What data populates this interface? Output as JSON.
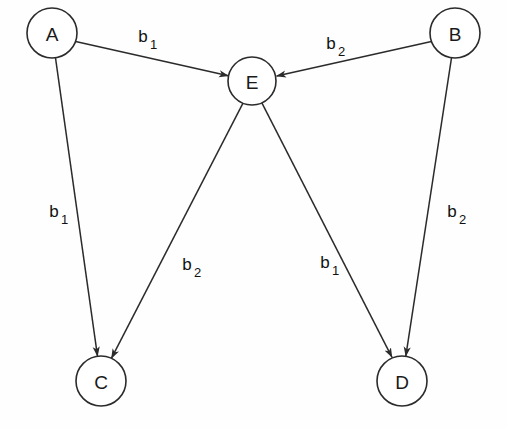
{
  "diagram": {
    "background_color": "#fefefe",
    "stroke_color": "#2b2b2b",
    "text_color": "#111111",
    "nodes": [
      {
        "id": "A",
        "label": "A",
        "cx": 52,
        "cy": 33,
        "r": 25
      },
      {
        "id": "B",
        "label": "B",
        "cx": 455,
        "cy": 33,
        "r": 25
      },
      {
        "id": "E",
        "label": "E",
        "cx": 252,
        "cy": 81,
        "r": 24
      },
      {
        "id": "C",
        "label": "C",
        "cx": 101,
        "cy": 381,
        "r": 25
      },
      {
        "id": "D",
        "label": "D",
        "cx": 402,
        "cy": 381,
        "r": 25
      }
    ],
    "edges": [
      {
        "id": "a-e",
        "from": "A",
        "to": "E",
        "label_base": "b",
        "label_sub": "1",
        "label_x": 143,
        "label_y": 42
      },
      {
        "id": "b-e",
        "from": "B",
        "to": "E",
        "label_base": "b",
        "label_sub": "2",
        "label_x": 331,
        "label_y": 49
      },
      {
        "id": "a-c",
        "from": "A",
        "to": "C",
        "label_base": "b",
        "label_sub": "1",
        "label_x": 54,
        "label_y": 217
      },
      {
        "id": "e-c",
        "from": "E",
        "to": "C",
        "label_base": "b",
        "label_sub": "2",
        "label_x": 187,
        "label_y": 270
      },
      {
        "id": "e-d",
        "from": "E",
        "to": "D",
        "label_base": "b",
        "label_sub": "1",
        "label_x": 325,
        "label_y": 268
      },
      {
        "id": "b-d",
        "from": "B",
        "to": "D",
        "label_base": "b",
        "label_sub": "2",
        "label_x": 452,
        "label_y": 217
      }
    ]
  }
}
